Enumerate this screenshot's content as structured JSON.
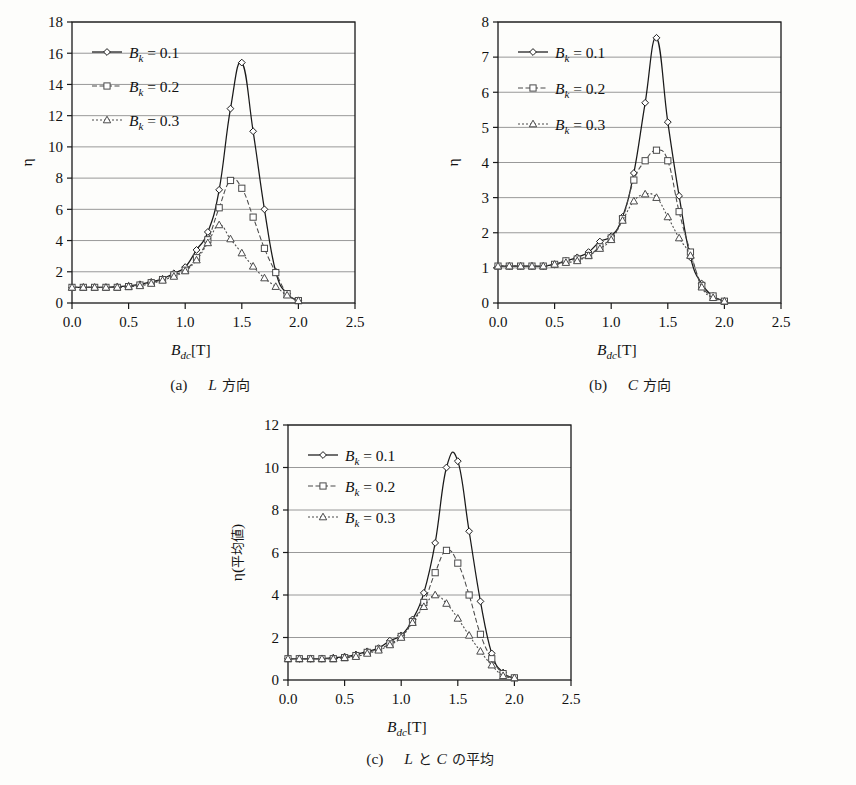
{
  "figure": {
    "background": "#fdfdfb",
    "series_styles": [
      {
        "key": "bk01",
        "label_base": "B",
        "label_sub": "k",
        "label_eq": " = 0.1",
        "marker": "diamond",
        "dash": "none",
        "color": "#1a1a1a"
      },
      {
        "key": "bk02",
        "label_base": "B",
        "label_sub": "k",
        "label_eq": " = 0.2",
        "marker": "square",
        "dash": "dashed",
        "color": "#4a4a4a"
      },
      {
        "key": "bk03",
        "label_base": "B",
        "label_sub": "k",
        "label_eq": " = 0.3",
        "marker": "triangle",
        "dash": "dotted",
        "color": "#4a4a4a"
      }
    ],
    "captions": {
      "a": {
        "index": "(a)",
        "var": "L",
        "jp": "方向"
      },
      "b": {
        "index": "(b)",
        "var": "C",
        "jp": "方向"
      },
      "c": {
        "index": "(c)",
        "var_1": "L",
        "jp_1": "と",
        "var_2": "C",
        "jp_2": "の平均"
      }
    },
    "axis_labels": {
      "x_base": "B",
      "x_sub": "dc",
      "x_unit": "[T]",
      "y_eta": "η",
      "y_eta_avg_paren_open": "(",
      "y_eta_avg_jp": "平均値",
      "y_eta_avg_paren_close": ")"
    }
  },
  "chart_data": [
    {
      "id": "panel-a",
      "type": "line",
      "title": "(a) L 方向",
      "xlabel": "B_dc [T]",
      "ylabel": "η",
      "xlim": [
        0.0,
        2.5
      ],
      "ylim": [
        0,
        18
      ],
      "xticks": [
        "0.0",
        "0.5",
        "1.0",
        "1.5",
        "2.0",
        "2.5"
      ],
      "xtick_values": [
        0.0,
        0.5,
        1.0,
        1.5,
        2.0,
        2.5
      ],
      "yticks": [
        "0",
        "2",
        "4",
        "6",
        "8",
        "10",
        "12",
        "14",
        "16",
        "18"
      ],
      "ytick_values": [
        0,
        2,
        4,
        6,
        8,
        10,
        12,
        14,
        16,
        18
      ],
      "grid": "horizontal",
      "legend_position": "top-left",
      "x": [
        0.0,
        0.1,
        0.2,
        0.3,
        0.4,
        0.5,
        0.6,
        0.7,
        0.8,
        0.9,
        1.0,
        1.1,
        1.2,
        1.3,
        1.4,
        1.5,
        1.6,
        1.7,
        1.8,
        1.9,
        2.0
      ],
      "series": [
        {
          "name": "B_k = 0.1",
          "values": [
            1.0,
            1.0,
            1.0,
            1.0,
            1.05,
            1.1,
            1.2,
            1.35,
            1.55,
            1.9,
            2.3,
            3.4,
            4.55,
            7.25,
            12.45,
            15.4,
            11.0,
            6.0,
            2.0,
            0.6,
            0.15
          ]
        },
        {
          "name": "B_k = 0.2",
          "values": [
            1.0,
            1.0,
            1.0,
            1.0,
            1.0,
            1.05,
            1.15,
            1.3,
            1.5,
            1.8,
            2.1,
            2.9,
            4.05,
            6.1,
            7.85,
            7.35,
            5.5,
            3.5,
            1.95,
            0.6,
            0.15
          ]
        },
        {
          "name": "B_k = 0.3",
          "values": [
            1.0,
            1.0,
            1.0,
            1.0,
            1.0,
            1.05,
            1.1,
            1.25,
            1.45,
            1.7,
            2.05,
            2.75,
            3.85,
            5.0,
            4.1,
            3.2,
            2.35,
            1.6,
            1.05,
            0.5,
            0.15
          ]
        }
      ]
    },
    {
      "id": "panel-b",
      "type": "line",
      "title": "(b) C 方向",
      "xlabel": "B_dc [T]",
      "ylabel": "η",
      "xlim": [
        0.0,
        2.5
      ],
      "ylim": [
        0,
        8
      ],
      "xticks": [
        "0.0",
        "0.5",
        "1.0",
        "1.5",
        "2.0",
        "2.5"
      ],
      "xtick_values": [
        0.0,
        0.5,
        1.0,
        1.5,
        2.0,
        2.5
      ],
      "yticks": [
        "0",
        "1",
        "2",
        "3",
        "4",
        "5",
        "6",
        "7",
        "8"
      ],
      "ytick_values": [
        0,
        1,
        2,
        3,
        4,
        5,
        6,
        7,
        8
      ],
      "grid": "horizontal",
      "legend_position": "top-left",
      "x": [
        0.0,
        0.1,
        0.2,
        0.3,
        0.4,
        0.5,
        0.6,
        0.7,
        0.8,
        0.9,
        1.0,
        1.1,
        1.2,
        1.3,
        1.4,
        1.5,
        1.6,
        1.7,
        1.8,
        1.9,
        2.0
      ],
      "series": [
        {
          "name": "B_k = 0.1",
          "values": [
            1.05,
            1.05,
            1.05,
            1.05,
            1.05,
            1.1,
            1.2,
            1.3,
            1.45,
            1.75,
            1.9,
            2.45,
            3.7,
            5.7,
            7.55,
            5.15,
            3.05,
            1.3,
            0.55,
            0.2,
            0.05
          ]
        },
        {
          "name": "B_k = 0.2",
          "values": [
            1.05,
            1.05,
            1.05,
            1.05,
            1.05,
            1.1,
            1.2,
            1.25,
            1.35,
            1.6,
            1.85,
            2.4,
            3.5,
            4.05,
            4.35,
            4.05,
            2.6,
            1.45,
            0.5,
            0.2,
            0.05
          ]
        },
        {
          "name": "B_k = 0.3",
          "values": [
            1.05,
            1.05,
            1.05,
            1.05,
            1.05,
            1.1,
            1.15,
            1.2,
            1.35,
            1.55,
            1.8,
            2.35,
            2.9,
            3.1,
            3.0,
            2.45,
            1.85,
            1.35,
            0.45,
            0.15,
            0.05
          ]
        }
      ]
    },
    {
      "id": "panel-c",
      "type": "line",
      "title": "(c) L と C の平均",
      "xlabel": "B_dc [T]",
      "ylabel": "η(平均値)",
      "xlim": [
        0.0,
        2.5
      ],
      "ylim": [
        0,
        12
      ],
      "xticks": [
        "0.0",
        "0.5",
        "1.0",
        "1.5",
        "2.0",
        "2.5"
      ],
      "xtick_values": [
        0.0,
        0.5,
        1.0,
        1.5,
        2.0,
        2.5
      ],
      "yticks": [
        "0",
        "2",
        "4",
        "6",
        "8",
        "10",
        "12"
      ],
      "ytick_values": [
        0,
        2,
        4,
        6,
        8,
        10,
        12
      ],
      "grid": "horizontal",
      "legend_position": "top-left",
      "x": [
        0.0,
        0.1,
        0.2,
        0.3,
        0.4,
        0.5,
        0.6,
        0.7,
        0.8,
        0.9,
        1.0,
        1.1,
        1.2,
        1.3,
        1.4,
        1.5,
        1.6,
        1.7,
        1.8,
        1.9,
        2.0
      ],
      "series": [
        {
          "name": "B_k = 0.1",
          "values": [
            1.0,
            1.0,
            1.0,
            1.0,
            1.05,
            1.1,
            1.2,
            1.35,
            1.5,
            1.85,
            2.1,
            2.85,
            4.1,
            6.45,
            10.0,
            10.3,
            7.0,
            3.7,
            1.25,
            0.35,
            0.1
          ]
        },
        {
          "name": "B_k = 0.2",
          "values": [
            1.0,
            1.0,
            1.0,
            1.0,
            1.0,
            1.05,
            1.15,
            1.3,
            1.45,
            1.7,
            2.05,
            2.75,
            3.65,
            5.05,
            6.1,
            5.5,
            4.0,
            2.15,
            1.0,
            0.3,
            0.1
          ]
        },
        {
          "name": "B_k = 0.3",
          "values": [
            1.0,
            1.0,
            1.0,
            1.0,
            1.0,
            1.05,
            1.1,
            1.25,
            1.4,
            1.65,
            2.0,
            2.7,
            3.45,
            4.0,
            3.6,
            2.9,
            2.1,
            1.35,
            0.7,
            0.2,
            0.1
          ]
        }
      ]
    }
  ]
}
